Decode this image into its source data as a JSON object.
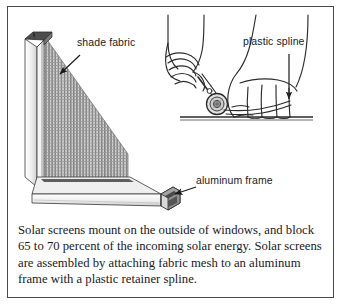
{
  "figure": {
    "border_color": "#4a4a4a",
    "background": "#ffffff"
  },
  "labels": {
    "shade_fabric": "shade fabric",
    "plastic_spline": "plastic spline",
    "aluminum_frame": "aluminum frame"
  },
  "illustration": {
    "frame_color": "#e8e8e8",
    "frame_edge_color": "#3a3a3a",
    "mesh_color": "#8c8c8c",
    "line_color": "#2b2b2b",
    "parts": [
      "aluminum-frame-vertical-rail",
      "aluminum-frame-bottom-rail",
      "shade-fabric-mesh",
      "frame-end-cap",
      "left-hand-with-spline-roller",
      "right-hand-holding-spline",
      "spline-roller-wheel",
      "work-surface-line"
    ]
  },
  "caption": {
    "line1": "Solar screens mount on the outside of windows, and block",
    "line2": "65 to 70 percent of the incoming solar energy. Solar screens",
    "line3": "are assembled by attaching fabric mesh to an aluminum",
    "line4": "frame with a plastic retainer spline."
  }
}
